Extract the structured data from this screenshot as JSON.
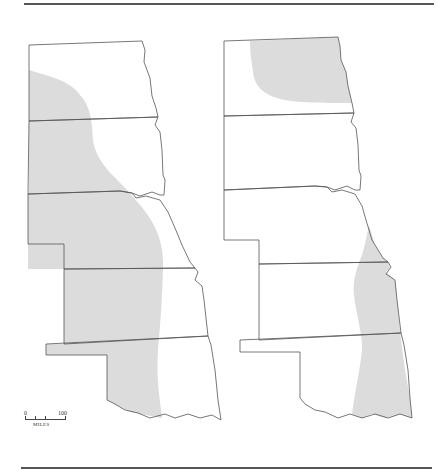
{
  "figure": {
    "type": "thematic map pair",
    "shading_color": "#dcdcdc",
    "border_color": "#555555"
  },
  "maps": [
    {
      "id": "left",
      "states": [
        "North Dakota",
        "South Dakota",
        "Nebraska",
        "Kansas",
        "Oklahoma"
      ],
      "shaded_area": "western portions of Dakotas, Nebraska, Kansas and Oklahoma"
    },
    {
      "id": "right",
      "states": [
        "North Dakota",
        "South Dakota",
        "Nebraska",
        "Kansas",
        "Oklahoma"
      ],
      "shaded_area": "northeastern North Dakota and eastern Nebraska, Kansas and Oklahoma"
    }
  ],
  "scale_bar": {
    "start_label": "0",
    "end_label": "100",
    "units": "MILES"
  }
}
